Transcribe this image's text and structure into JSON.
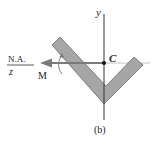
{
  "figure": {
    "caption": "(b)",
    "labels": {
      "y_axis": "y",
      "z_axis": "z",
      "neutral_axis": "N.A.",
      "centroid": "C",
      "moment": "M"
    },
    "colors": {
      "section_fill": "#a8a8a8",
      "section_stroke": "#6f6f6f",
      "axis": "#333333",
      "arrow": "#7d7d7d",
      "na_line": "#bdbdbd"
    }
  }
}
